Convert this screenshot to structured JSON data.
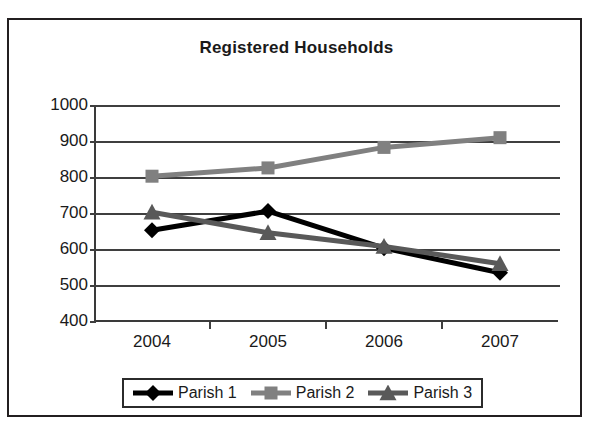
{
  "chart_data": {
    "type": "line",
    "title": "Registered Households",
    "xlabel": "",
    "ylabel": "",
    "categories": [
      "2004",
      "2005",
      "2006",
      "2007"
    ],
    "ylim": [
      400,
      1000
    ],
    "yticks": [
      400,
      500,
      600,
      700,
      800,
      900,
      1000
    ],
    "grid": true,
    "legend_position": "bottom",
    "series": [
      {
        "name": "Parish 1",
        "marker": "diamond",
        "color": "#000000",
        "values": [
          655,
          708,
          605,
          537
        ]
      },
      {
        "name": "Parish 2",
        "marker": "square",
        "color": "#808080",
        "values": [
          805,
          828,
          885,
          912
        ]
      },
      {
        "name": "Parish 3",
        "marker": "triangle",
        "color": "#595959",
        "values": [
          705,
          648,
          610,
          562
        ]
      }
    ]
  },
  "colors": {
    "border": "#231f20",
    "axis": "#3f3f3f",
    "text": "#1a1a1a",
    "background": "#ffffff"
  }
}
